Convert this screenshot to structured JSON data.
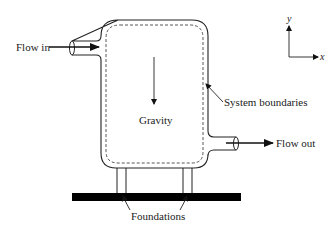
{
  "diagram": {
    "labels": {
      "flow_in": "Flow in",
      "flow_out": "Flow out",
      "gravity": "Gravity",
      "system_boundaries": "System boundaries",
      "foundations": "Foundations"
    },
    "axes": {
      "x_label": "x",
      "y_label": "y"
    },
    "colors": {
      "stroke": "#222222",
      "boundary_dash": "#444444",
      "ground": "#000000",
      "background": "#ffffff"
    }
  }
}
